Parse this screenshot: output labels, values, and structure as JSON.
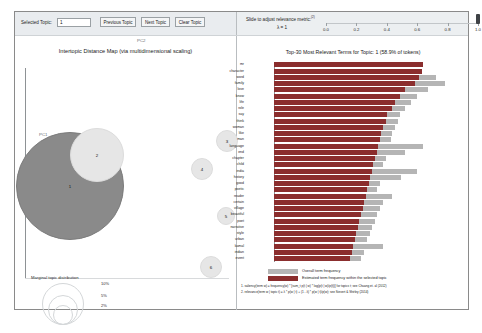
{
  "toolbar": {
    "selected_topic_label": "Selected Topic:",
    "topic_value": "1",
    "previous_topic_label": "Previous Topic",
    "next_topic_label": "Next Topic",
    "clear_topic_label": "Clear Topic"
  },
  "slider": {
    "caption": "Slide to adjust relevance metric:",
    "caption_superscript": "(2)",
    "lambda_text": "λ = 1",
    "ticks": [
      "0.0",
      "0.2",
      "0.4",
      "0.6",
      "0.8",
      "1.0"
    ],
    "handle_value": 1.0
  },
  "left_panel": {
    "title": "Intertopic Distance Map (via multidimensional scaling)",
    "axis_x_label": "PC2",
    "axis_y_label": "PC1",
    "marginal_title": "Marginal topic distribution",
    "marginal_sizes": [
      "2%",
      "5%",
      "10%"
    ]
  },
  "right_panel": {
    "title": "Top-30 Most Relevant Terms for Topic: 1 (58.9% of tokens)",
    "legend": {
      "overall_label": "Overall term frequency",
      "estimated_label": "Estimated term frequency within the selected topic",
      "overall_color": "#b5b5b5",
      "estimated_color": "#8b2e2e"
    },
    "footnotes": [
      "1. saliency(term w) = frequency(w) * [sum_t p(t | w) * log(p(t | w)/p(t))] for topics t; see Chuang et. al (2012)",
      "2. relevance(term w | topic t) = λ * p(w | t) + (1 - λ) * p(w | t)/p(w); see Sievert & Shirley (2014)"
    ]
  },
  "chart_data": [
    {
      "type": "scatter",
      "title": "Intertopic Distance Map (via multidimensional scaling)",
      "xlabel": "PC2",
      "ylabel": "PC1",
      "selected_topic": 1,
      "selected_color": "#8a8a8a",
      "unselected_color": "#e6e6e6",
      "points": [
        {
          "topic": "1",
          "cx": 55,
          "cy": 150,
          "r": 54,
          "selected": true
        },
        {
          "topic": "2",
          "cx": 82,
          "cy": 119,
          "r": 27,
          "selected": false
        },
        {
          "topic": "3",
          "cx": 212,
          "cy": 105,
          "r": 11,
          "selected": false
        },
        {
          "topic": "4",
          "cx": 187,
          "cy": 133,
          "r": 11,
          "selected": false
        },
        {
          "topic": "5",
          "cx": 211,
          "cy": 180,
          "r": 9,
          "selected": false
        },
        {
          "topic": "6",
          "cx": 196,
          "cy": 231,
          "r": 11,
          "selected": false
        }
      ]
    },
    {
      "type": "bar",
      "title": "Top-30 Most Relevant Terms for Topic: 1 (58.9% of tokens)",
      "orientation": "horizontal",
      "xlabel": "",
      "ylabel": "",
      "series": [
        {
          "name": "Overall term frequency",
          "color": "#b5b5b5"
        },
        {
          "name": "Estimated term frequency within the selected topic",
          "color": "#8b2e2e"
        }
      ],
      "categories": [
        "mr",
        "character",
        "word",
        "family",
        "love",
        "know",
        "life",
        "role",
        "say",
        "think",
        "woman",
        "like",
        "man",
        "language",
        "end",
        "chapter",
        "child",
        "india",
        "history",
        "good",
        "poetic",
        "reader",
        "certain",
        "village",
        "beautiful",
        "poet",
        "narrative",
        "style",
        "urban",
        "kamal",
        "indian",
        "event"
      ],
      "estimated": [
        96,
        95,
        93,
        91,
        84,
        81,
        78,
        76,
        73,
        72,
        70,
        69,
        68,
        67,
        66,
        65,
        64,
        63,
        62,
        61,
        60,
        59,
        58,
        57,
        56,
        55,
        54,
        53,
        52,
        51,
        50,
        49
      ],
      "overall": [
        96,
        95,
        104,
        110,
        99,
        92,
        88,
        84,
        81,
        80,
        78,
        76,
        75,
        96,
        84,
        72,
        70,
        92,
        82,
        68,
        66,
        76,
        70,
        68,
        66,
        65,
        63,
        62,
        60,
        70,
        58,
        56
      ],
      "xlim": [
        0,
        130
      ]
    }
  ]
}
